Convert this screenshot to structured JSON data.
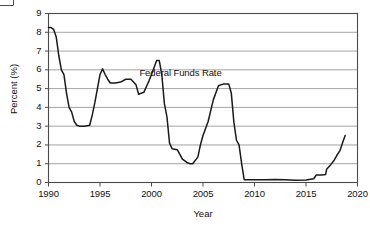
{
  "figure": {
    "background_color": "#ffffff",
    "line_color": "#1a1a1a",
    "grid_color": "#8c8c8c",
    "axis_color": "#4a4a4a",
    "corner_artifact_name": "cropped-label-box"
  },
  "chart_data": {
    "type": "line",
    "title": "",
    "xlabel": "Year",
    "ylabel": "Percent (%)",
    "xlim": [
      1990,
      2020
    ],
    "ylim": [
      0,
      9
    ],
    "xticks": [
      1990,
      1995,
      2000,
      2005,
      2010,
      2015,
      2020
    ],
    "xtick_labels": [
      "1990",
      "1995",
      "2000",
      "2005",
      "2010",
      "2015",
      "2020"
    ],
    "yticks": [
      0,
      1,
      2,
      3,
      4,
      5,
      6,
      7,
      8,
      9
    ],
    "ytick_labels": [
      "0",
      "1",
      "2",
      "3",
      "4",
      "5",
      "6",
      "7",
      "8",
      "9"
    ],
    "grid": "horizontal",
    "legend": "none",
    "annotations": [
      {
        "text": "Federal Funds Rate",
        "x": 2003.1,
        "y": 5.85
      }
    ],
    "series": [
      {
        "name": "Federal Funds Rate",
        "x": [
          1990.0,
          1990.25,
          1990.5,
          1990.75,
          1991.0,
          1991.25,
          1991.5,
          1991.75,
          1992.0,
          1992.25,
          1992.5,
          1992.75,
          1993.0,
          1993.5,
          1994.0,
          1994.25,
          1994.5,
          1994.75,
          1995.0,
          1995.25,
          1995.5,
          1995.75,
          1996.0,
          1996.5,
          1997.0,
          1997.5,
          1998.0,
          1998.5,
          1998.75,
          1999.0,
          1999.25,
          1999.5,
          1999.75,
          2000.0,
          2000.5,
          2000.75,
          2001.0,
          2001.25,
          2001.5,
          2001.75,
          2002.0,
          2002.5,
          2003.0,
          2003.5,
          2003.75,
          2004.0,
          2004.5,
          2004.75,
          2005.0,
          2005.5,
          2006.0,
          2006.5,
          2007.0,
          2007.5,
          2007.75,
          2008.0,
          2008.25,
          2008.5,
          2008.75,
          2009.0,
          2010.0,
          2011.0,
          2012.0,
          2013.0,
          2014.0,
          2015.0,
          2015.75,
          2016.0,
          2016.5,
          2016.9,
          2017.0,
          2017.4,
          2017.75,
          2018.0,
          2018.3,
          2018.6,
          2018.8
        ],
        "y": [
          8.25,
          8.25,
          8.15,
          7.75,
          6.75,
          6.0,
          5.75,
          4.75,
          4.0,
          3.75,
          3.25,
          3.05,
          3.0,
          3.0,
          3.05,
          3.6,
          4.25,
          5.0,
          5.75,
          6.05,
          5.75,
          5.5,
          5.3,
          5.3,
          5.35,
          5.5,
          5.5,
          5.2,
          4.7,
          4.75,
          4.8,
          5.1,
          5.4,
          5.75,
          6.5,
          6.5,
          5.75,
          4.2,
          3.5,
          2.1,
          1.8,
          1.75,
          1.25,
          1.05,
          1.0,
          1.0,
          1.35,
          2.0,
          2.5,
          3.25,
          4.4,
          5.15,
          5.25,
          5.25,
          4.75,
          3.2,
          2.25,
          2.0,
          1.0,
          0.15,
          0.15,
          0.15,
          0.16,
          0.15,
          0.12,
          0.13,
          0.2,
          0.4,
          0.4,
          0.42,
          0.7,
          0.95,
          1.2,
          1.45,
          1.7,
          2.2,
          2.5
        ]
      }
    ]
  }
}
